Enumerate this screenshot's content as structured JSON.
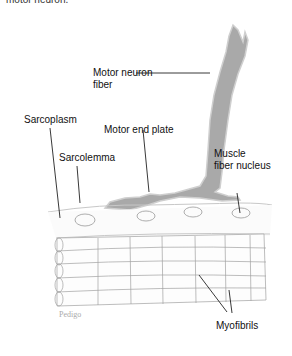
{
  "diagram": {
    "top_caption_partial": "motor neuron.",
    "labels": {
      "motor_neuron_fiber_line1": "Motor neuron",
      "motor_neuron_fiber_line2": "fiber",
      "sarcoplasm": "Sarcoplasm",
      "sarcolemma": "Sarcolemma",
      "motor_end_plate": "Motor end plate",
      "muscle_fiber_nucleus_line1": "Muscle",
      "muscle_fiber_nucleus_line2": "fiber nucleus",
      "myofibrils": "Myofibrils"
    },
    "credit": "Pedigo",
    "colors": {
      "nerve_fill": "#a9a9a9",
      "nerve_edge": "#d0d0d0",
      "line": "#222222",
      "myofibril_stroke": "#999999",
      "background": "#ffffff"
    }
  }
}
